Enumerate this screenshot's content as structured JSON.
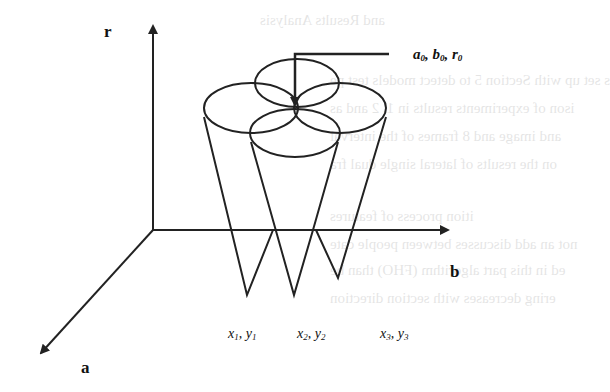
{
  "diagram": {
    "axes": {
      "vertical": {
        "label": "r"
      },
      "horizontal": {
        "label": "b"
      },
      "depth": {
        "label": "a"
      }
    },
    "apex_label": {
      "a": "a",
      "a_sub": "0",
      "b": "b",
      "b_sub": "0",
      "r": "r",
      "r_sub": "0"
    },
    "points": [
      {
        "x": "x",
        "x_sub": "1",
        "y": "y",
        "y_sub": "1"
      },
      {
        "x": "x",
        "x_sub": "2",
        "y": "y",
        "y_sub": "2"
      },
      {
        "x": "x",
        "x_sub": "3",
        "y": "y",
        "y_sub": "3"
      }
    ],
    "line_color": "#222222",
    "background": "#ffffff"
  },
  "background_text": {
    "lines": [
      "and Results Analysis",
      "s set up with Section 5 to detect models test pe",
      "ison of experiments results in 1, 2 and as",
      "and image and 8 frames of the interval",
      "on the results of lateral single dual fra",
      "ition process of features",
      "not an add discusses between people cate",
      "ed in this part algorithm (FHO) than be",
      "ering decreases with section direction"
    ]
  }
}
